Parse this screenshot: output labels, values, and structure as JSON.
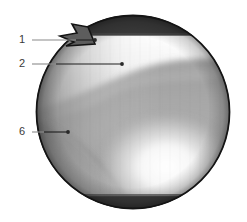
{
  "figure": {
    "name": "annotated-circular-endoscopic-image",
    "canvas": {
      "width": 247,
      "height": 222,
      "background": "#ffffff"
    },
    "image_region": {
      "shape": "circle",
      "center_x": 133,
      "center_y": 112,
      "radius": 97,
      "outline_color": "#141414",
      "notch": {
        "name": "triangular-notch-upper-left",
        "description": "beak-shaped triangular protrusion on upper-left rim"
      }
    },
    "bands": [
      {
        "name": "top-dark-band",
        "position": "top",
        "color": "#3b3b3b",
        "y_start": 13,
        "y_end": 35
      },
      {
        "name": "bottom-dark-band",
        "position": "bottom",
        "color": "#3b3b3b",
        "y_start": 196,
        "y_end": 212
      }
    ],
    "tones": {
      "bright_highlight": "#fafafa",
      "mid_gray": "#9a9a9a",
      "dark_gray": "#6e6e6e",
      "band_dark": "#3b3b3b",
      "outline": "#141414",
      "leader": "#8a8a8a",
      "leader_dark": "#1e1e1e",
      "label_text": "#3a3a3a"
    }
  },
  "annotations": [
    {
      "id": "annotation-1",
      "label": "1",
      "label_x": 22,
      "label_y": 40,
      "line_start_x": 32,
      "line_start_y": 40,
      "line_end_x": 95,
      "line_end_y": 40,
      "dot_x": 95,
      "dot_y": 40,
      "dot_r": 1.9
    },
    {
      "id": "annotation-2",
      "label": "2",
      "label_x": 22,
      "label_y": 64,
      "line_start_x": 32,
      "line_start_y": 64,
      "line_end_x": 122,
      "line_end_y": 64,
      "dot_x": 122,
      "dot_y": 64,
      "dot_r": 1.9
    },
    {
      "id": "annotation-6",
      "label": "6",
      "label_x": 22,
      "label_y": 132,
      "line_start_x": 32,
      "line_start_y": 132,
      "line_end_x": 68,
      "line_end_y": 132,
      "dot_x": 68,
      "dot_y": 132,
      "dot_r": 1.9
    }
  ]
}
